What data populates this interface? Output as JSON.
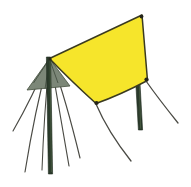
{
  "illustration": {
    "title": "A-frame tarp shelter",
    "subject_name": "tarp-shelter-diagram",
    "background_color": "#ffffff",
    "canvas": {
      "width": 191,
      "height": 187
    },
    "palette": {
      "tarp_fill": "#F6E52B",
      "tarp_fill_shadow": "#EFDD22",
      "tarp_outline": "#3A3A20",
      "end_panel_fill": "#7C8778",
      "end_panel_fill_dark": "#6A7566",
      "pole_fill": "#2B3B2B",
      "pole_fill_light": "#41543F",
      "pole_outline": "#1E2A1E",
      "guy_line_color": "#4A4A44",
      "grommet_color": "#24241A"
    },
    "parts": [
      {
        "name": "yellow-tarp",
        "label": "Yellow tarpaulin sheet",
        "fill": "#F6E52B",
        "outline": "#3A3A20",
        "path": "M 49.5 58.5 L 142 15 L 147.5 80.5 Q 120 95 96 103.5 Q 70 80 49.5 58.5 Z",
        "corners": [
          {
            "name": "apex-corner",
            "x": 49.5,
            "y": 58.5
          },
          {
            "name": "top-right-corner",
            "x": 142,
            "y": 15
          },
          {
            "name": "right-corner",
            "x": 147.5,
            "y": 80.5
          },
          {
            "name": "bottom-corner",
            "x": 96,
            "y": 103.5
          }
        ]
      },
      {
        "name": "end-panel",
        "label": "Shaded triangular end panel",
        "fill": "#7C8778",
        "path": "M 49.5 58.5 L 70 86 L 27 90 Z"
      },
      {
        "name": "left-pole",
        "label": "Left upright pole",
        "fill": "#2B3B2B",
        "x1": 48.5,
        "y1": 57,
        "x2": 50.5,
        "y2": 174,
        "width": 4.2
      },
      {
        "name": "right-pole",
        "label": "Right upright pole",
        "fill": "#2B3B2B",
        "x1": 137.5,
        "y1": 76,
        "x2": 140.5,
        "y2": 130,
        "width": 4.2
      }
    ],
    "grommets": [
      {
        "name": "grommet-top-right",
        "cx": 141.5,
        "cy": 16.5,
        "r": 1.9
      },
      {
        "name": "grommet-right",
        "cx": 146.5,
        "cy": 79.5,
        "r": 2.1
      },
      {
        "name": "grommet-bottom",
        "cx": 96.5,
        "cy": 103,
        "r": 2.1
      },
      {
        "name": "grommet-apex",
        "cx": 50,
        "cy": 59,
        "r": 1.6
      }
    ],
    "guy_lines": [
      {
        "name": "guy-line-left-far",
        "path": "M 48 60 Q 33 96 13 131",
        "width": 1.15
      },
      {
        "name": "guy-line-left-mid",
        "path": "M 48 62 Q 35 110 25 172",
        "width": 1.15
      },
      {
        "name": "guy-line-left-inner",
        "path": "M 49 63 Q 44 115 42 170",
        "width": 1.05
      },
      {
        "name": "guy-line-right-inner",
        "path": "M 51 62 Q 60 115 69 166",
        "width": 1.15
      },
      {
        "name": "guy-line-right-mid",
        "path": "M 52 61 Q 66 100 80 158",
        "width": 1.15
      },
      {
        "name": "guy-line-bottom-corner",
        "path": "M 96 104 Q 108 132 131 161",
        "width": 1.3
      },
      {
        "name": "guy-line-right-corner",
        "path": "M 146 81 Q 158 98 178 123",
        "width": 1.3
      },
      {
        "name": "guy-line-end-panel-a",
        "path": "M 49.5 60 L 27 90",
        "width": 0.9
      },
      {
        "name": "guy-line-end-panel-b",
        "path": "M 49.5 60 L 70 86",
        "width": 0.9
      }
    ]
  }
}
